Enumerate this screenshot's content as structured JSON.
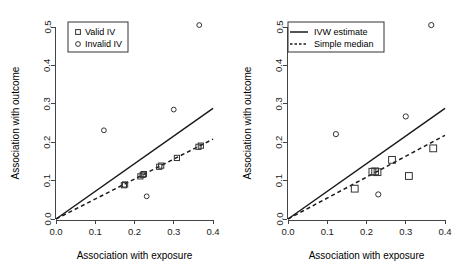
{
  "figure": {
    "width": 463,
    "height": 278,
    "background": "#ffffff",
    "panel_count": 2
  },
  "chart_data": [
    {
      "type": "scatter",
      "panel": "left",
      "title": "",
      "xlabel": "Association with exposure",
      "ylabel": "Association with outcome",
      "xlim": [
        0.0,
        0.4
      ],
      "ylim": [
        0.0,
        0.5
      ],
      "xticks": [
        "0.0",
        "0.1",
        "0.2",
        "0.3",
        "0.4"
      ],
      "yticks": [
        "0.0",
        "0.1",
        "0.2",
        "0.3",
        "0.4",
        "0.5"
      ],
      "xtick_values": [
        0.0,
        0.1,
        0.2,
        0.3,
        0.4
      ],
      "ytick_values": [
        0.0,
        0.1,
        0.2,
        0.3,
        0.4,
        0.5
      ],
      "grid": false,
      "legend_position": "top-left",
      "legend": [
        {
          "label": "Valid IV",
          "marker": "square"
        },
        {
          "label": "Invalid IV",
          "marker": "circle"
        }
      ],
      "series": [
        {
          "name": "Valid IV",
          "marker": "square",
          "points": [
            {
              "x": 0.173,
              "y": 0.088
            },
            {
              "x": 0.176,
              "y": 0.09
            },
            {
              "x": 0.215,
              "y": 0.111
            },
            {
              "x": 0.221,
              "y": 0.115
            },
            {
              "x": 0.224,
              "y": 0.117
            },
            {
              "x": 0.263,
              "y": 0.136
            },
            {
              "x": 0.268,
              "y": 0.139
            },
            {
              "x": 0.308,
              "y": 0.159
            },
            {
              "x": 0.363,
              "y": 0.188
            },
            {
              "x": 0.369,
              "y": 0.191
            }
          ]
        },
        {
          "name": "Invalid IV",
          "marker": "circle",
          "points": [
            {
              "x": 0.122,
              "y": 0.231
            },
            {
              "x": 0.231,
              "y": 0.059
            },
            {
              "x": 0.3,
              "y": 0.285
            },
            {
              "x": 0.365,
              "y": 0.505
            }
          ]
        }
      ],
      "lines": [
        {
          "name": "IVW estimate",
          "style": "solid",
          "slope": 0.72,
          "intercept": 0.0
        },
        {
          "name": "Simple median",
          "style": "dashed",
          "slope": 0.52,
          "intercept": 0.0
        }
      ]
    },
    {
      "type": "scatter",
      "panel": "right",
      "title": "",
      "xlabel": "Association with exposure",
      "ylabel": "Association with outcome",
      "xlim": [
        0.0,
        0.4
      ],
      "ylim": [
        0.0,
        0.5
      ],
      "xticks": [
        "0.0",
        "0.1",
        "0.2",
        "0.3",
        "0.4"
      ],
      "yticks": [
        "0.0",
        "0.1",
        "0.2",
        "0.3",
        "0.4",
        "0.5"
      ],
      "xtick_values": [
        0.0,
        0.1,
        0.2,
        0.3,
        0.4
      ],
      "ytick_values": [
        0.0,
        0.1,
        0.2,
        0.3,
        0.4,
        0.5
      ],
      "grid": false,
      "legend_position": "top-left",
      "legend": [
        {
          "label": "IVW estimate",
          "marker": "line-solid"
        },
        {
          "label": "Simple median",
          "marker": "line-dashed"
        }
      ],
      "series": [
        {
          "name": "Valid IV",
          "marker": "square",
          "points": [
            {
              "x": 0.17,
              "y": 0.079
            },
            {
              "x": 0.215,
              "y": 0.123
            },
            {
              "x": 0.222,
              "y": 0.124
            },
            {
              "x": 0.228,
              "y": 0.122
            },
            {
              "x": 0.265,
              "y": 0.154
            },
            {
              "x": 0.308,
              "y": 0.112
            },
            {
              "x": 0.37,
              "y": 0.184
            }
          ]
        },
        {
          "name": "Invalid IV",
          "marker": "circle",
          "points": [
            {
              "x": 0.122,
              "y": 0.221
            },
            {
              "x": 0.23,
              "y": 0.064
            },
            {
              "x": 0.3,
              "y": 0.267
            },
            {
              "x": 0.365,
              "y": 0.505
            }
          ]
        }
      ],
      "lines": [
        {
          "name": "IVW estimate",
          "style": "solid",
          "slope": 0.72,
          "intercept": 0.0
        },
        {
          "name": "Simple median",
          "style": "dashed",
          "slope": 0.545,
          "intercept": 0.0
        }
      ]
    }
  ]
}
